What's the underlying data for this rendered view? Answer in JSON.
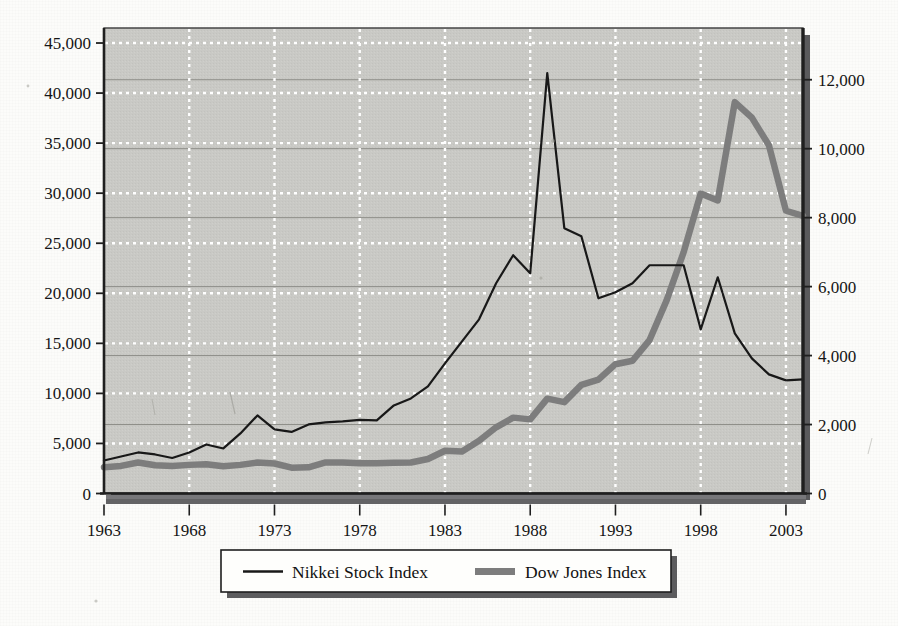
{
  "chart_data": {
    "type": "line",
    "title": "",
    "subtitle": "",
    "xlabel": "",
    "ylabel": "",
    "y2label": "",
    "grid": true,
    "legend_position": "bottom",
    "x": [
      1963,
      1964,
      1965,
      1966,
      1967,
      1968,
      1969,
      1970,
      1971,
      1972,
      1973,
      1974,
      1975,
      1976,
      1977,
      1978,
      1979,
      1980,
      1981,
      1982,
      1983,
      1984,
      1985,
      1986,
      1987,
      1988,
      1989,
      1990,
      1991,
      1992,
      1993,
      1994,
      1995,
      1996,
      1997,
      1998,
      1999,
      2000,
      2001,
      2002,
      2003,
      2004
    ],
    "xtick_labels": [
      "1963",
      "1968",
      "1973",
      "1978",
      "1983",
      "1988",
      "1993",
      "1998",
      "2003"
    ],
    "xticks": [
      1963,
      1968,
      1973,
      1978,
      1983,
      1988,
      1993,
      1998,
      2003
    ],
    "xlim": [
      1963,
      2004
    ],
    "left_axis": {
      "label": "Nikkei Stock Index",
      "ylim": [
        0,
        46500
      ],
      "ticks": [
        0,
        5000,
        10000,
        15000,
        20000,
        25000,
        30000,
        35000,
        40000,
        45000
      ],
      "tick_labels": [
        "0",
        "5,000",
        "10,000",
        "15,000",
        "20,000",
        "25,000",
        "30,000",
        "35,000",
        "40,000",
        "45,000"
      ]
    },
    "right_axis": {
      "label": "Dow Jones Index",
      "ylim": [
        0,
        13500
      ],
      "ticks": [
        0,
        2000,
        4000,
        6000,
        8000,
        10000,
        12000
      ],
      "tick_labels": [
        "0",
        "2,000",
        "4,000",
        "6,000",
        "8,000",
        "10,000",
        "12,000"
      ]
    },
    "series": [
      {
        "name": "Nikkei Stock Index",
        "axis": "left",
        "color": "#181818",
        "style": "thin-solid",
        "width": 2.2,
        "values": [
          3300,
          3700,
          4100,
          3900,
          3550,
          4100,
          4900,
          4500,
          6000,
          7800,
          6400,
          6150,
          6900,
          7100,
          7200,
          7350,
          7300,
          8800,
          9500,
          10700,
          13000,
          15200,
          17400,
          21000,
          23800,
          22000,
          42000,
          26500,
          25700,
          19500,
          20100,
          21000,
          22800,
          22800,
          22800,
          16400,
          21600,
          16000,
          13500,
          11900,
          11300,
          11400
        ]
      },
      {
        "name": "Dow Jones Index",
        "axis": "right",
        "color": "#7d7d7d",
        "style": "thick-solid",
        "width": 6.5,
        "values": [
          760,
          800,
          900,
          820,
          800,
          830,
          850,
          790,
          830,
          900,
          870,
          750,
          760,
          900,
          900,
          880,
          880,
          890,
          900,
          1000,
          1240,
          1220,
          1530,
          1920,
          2200,
          2150,
          2750,
          2650,
          3150,
          3300,
          3750,
          3850,
          4450,
          5600,
          7000,
          8700,
          8500,
          11350,
          10900,
          10100,
          8200,
          8050
        ]
      }
    ],
    "annotations": []
  },
  "legend": {
    "items": [
      {
        "label": "Nikkei Stock Index",
        "marker": "thin-line",
        "color": "#181818"
      },
      {
        "label": "Dow Jones Index",
        "marker": "thick-line",
        "color": "#7d7d7d"
      }
    ]
  },
  "colors": {
    "plot_background": "#c9c9c5",
    "gridline_white": "#ffffff",
    "gridline_dark": "#8d8d88",
    "axis": "#2a2a2a",
    "shadow": "#58585a",
    "page": "#fcfcfa"
  }
}
